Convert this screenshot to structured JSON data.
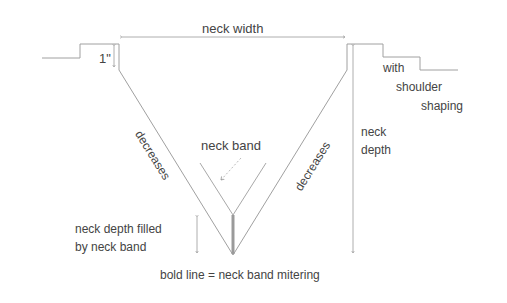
{
  "labels": {
    "neck_width": "neck width",
    "one_inch": "1\"",
    "shoulder_line1": "with",
    "shoulder_line2": "shoulder",
    "shoulder_line3": "shaping",
    "decreases_left": "decreases",
    "decreases_right": "decreases",
    "neck_band": "neck band",
    "neck_depth_line1": "neck",
    "neck_depth_line2": "depth",
    "filled_line1": "neck depth filled",
    "filled_line2": "by neck band",
    "legend": "bold line = neck band mitering"
  },
  "colors": {
    "line": "#999999",
    "bold_line": "#9a9a9a",
    "text": "#444444"
  }
}
